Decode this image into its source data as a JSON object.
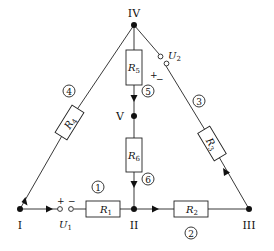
{
  "diagram": {
    "type": "circuit-graph",
    "nodes": [
      {
        "id": "I",
        "label": "I",
        "x": 20,
        "y": 209
      },
      {
        "id": "II",
        "label": "II",
        "x": 134,
        "y": 209
      },
      {
        "id": "III",
        "label": "III",
        "x": 249,
        "y": 209
      },
      {
        "id": "IV",
        "label": "IV",
        "x": 134,
        "y": 25
      },
      {
        "id": "V",
        "label": "V",
        "x": 134,
        "y": 116
      }
    ],
    "branches": [
      {
        "number": "1",
        "from": "I",
        "to": "II",
        "resistor": "R",
        "resistor_sub": "1",
        "source": "U",
        "source_sub": "1",
        "source_plus": "+",
        "source_minus": "−"
      },
      {
        "number": "2",
        "from": "II",
        "to": "III",
        "resistor": "R",
        "resistor_sub": "2"
      },
      {
        "number": "3",
        "from": "III",
        "to": "IV",
        "resistor": "R",
        "resistor_sub": "3",
        "source": "U",
        "source_sub": "2",
        "source_plus": "+",
        "source_minus": "−"
      },
      {
        "number": "4",
        "from": "I",
        "to": "IV",
        "resistor": "R",
        "resistor_sub": "4"
      },
      {
        "number": "5",
        "from": "IV",
        "to": "V",
        "resistor": "R",
        "resistor_sub": "5"
      },
      {
        "number": "6",
        "from": "V",
        "to": "II",
        "resistor": "R",
        "resistor_sub": "6"
      }
    ]
  }
}
